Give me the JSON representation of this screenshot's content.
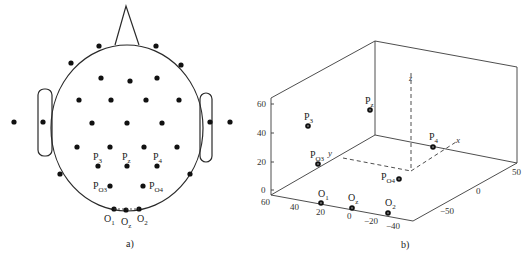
{
  "panel_a": {
    "caption": "a)",
    "labels": {
      "p3": {
        "base": "P",
        "sub": "3"
      },
      "pz": {
        "base": "P",
        "sub": "z"
      },
      "p4": {
        "base": "P",
        "sub": "4"
      },
      "po3": {
        "base": "P",
        "sub": "O3"
      },
      "po4": {
        "base": "P",
        "sub": "O4"
      },
      "o1": {
        "base": "O",
        "sub": "1"
      },
      "oz": {
        "base": "O",
        "sub": "z"
      },
      "o2": {
        "base": "O",
        "sub": "2"
      }
    }
  },
  "panel_b": {
    "caption": "b)",
    "axis_labels": {
      "x": "x",
      "y": "y",
      "z": "z"
    },
    "z_ticks": [
      "60",
      "40",
      "20",
      "0"
    ],
    "y_ticks": [
      "60",
      "40",
      "20",
      "0",
      "−20",
      "−40"
    ],
    "x_ticks": [
      "50",
      "0",
      "−50"
    ],
    "points": {
      "p3": {
        "base": "P",
        "sub": "3"
      },
      "pz": {
        "base": "P",
        "sub": "z"
      },
      "p4": {
        "base": "P",
        "sub": "4"
      },
      "po3": {
        "base": "P",
        "sub": "O3"
      },
      "po4": {
        "base": "P",
        "sub": "O4"
      },
      "o1": {
        "base": "O",
        "sub": "1"
      },
      "oz": {
        "base": "O",
        "sub": "z"
      },
      "o2": {
        "base": "O",
        "sub": "2"
      }
    }
  }
}
